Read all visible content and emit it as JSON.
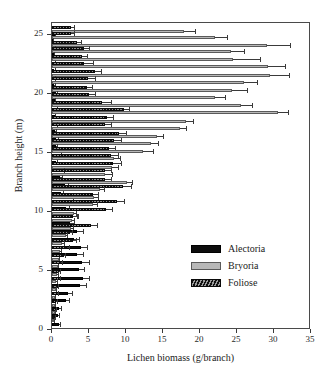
{
  "chart_data": {
    "type": "bar",
    "orientation": "horizontal",
    "title": "",
    "xlabel": "Lichen biomass (g/branch)",
    "ylabel": "Branch height (m)",
    "xlim": [
      0,
      35
    ],
    "ylim": [
      0,
      26
    ],
    "xticks": [
      0,
      5,
      10,
      15,
      20,
      25,
      30,
      35
    ],
    "yticks": [
      0,
      5,
      10,
      15,
      20,
      25
    ],
    "grid": false,
    "legend_position": "center-right",
    "legend": [
      "Alectoria",
      "Bryoria",
      "Foliose"
    ],
    "colors": {
      "Alectoria": "#0d0d0d",
      "Bryoria": "#b8b8b8",
      "Foliose": "#2b2b2b",
      "axis": "#3a3a3a",
      "error_bar": "#3a3a3a"
    },
    "categories": [
      25.4,
      24.9,
      24.2,
      23.7,
      23.0,
      22.4,
      21.7,
      21.1,
      20.4,
      19.8,
      19.1,
      18.5,
      17.8,
      17.2,
      16.5,
      15.9,
      15.2,
      14.6,
      13.9,
      13.3,
      12.6,
      12.0,
      11.3,
      10.7,
      10.0,
      9.4,
      8.7,
      8.1,
      7.4,
      6.8,
      6.1,
      5.5,
      4.8,
      4.2,
      3.5,
      2.9,
      2.2,
      1.6,
      0.9
    ],
    "series": [
      {
        "name": "Alectoria",
        "values": [
          0.35,
          0.2,
          0.3,
          0.25,
          0.4,
          0.3,
          0.35,
          0.3,
          0.5,
          0.35,
          0.55,
          0.4,
          0.5,
          0.45,
          0.6,
          0.5,
          1.0,
          0.55,
          1.3,
          1.1,
          1.7,
          1.2,
          2.3,
          1.9,
          2.8,
          2.4,
          3.4,
          3.0,
          3.9,
          3.4,
          4.1,
          3.6,
          4.2,
          3.8,
          2.2,
          1.9,
          1.0,
          0.8,
          0.9
        ],
        "errors": [
          0.2,
          0.1,
          0.2,
          0.15,
          0.2,
          0.2,
          0.2,
          0.2,
          0.25,
          0.2,
          0.3,
          0.2,
          0.25,
          0.25,
          0.3,
          0.25,
          0.4,
          0.3,
          0.5,
          0.4,
          0.6,
          0.45,
          0.7,
          0.6,
          0.8,
          0.7,
          0.9,
          0.8,
          1.0,
          0.9,
          1.0,
          0.9,
          1.0,
          0.9,
          0.7,
          0.6,
          0.4,
          0.3,
          0.35
        ]
      },
      {
        "name": "Bryoria",
        "values": [
          17.9,
          22.0,
          29.1,
          24.2,
          24.5,
          29.2,
          29.4,
          25.9,
          24.3,
          22.0,
          25.5,
          30.6,
          18.1,
          17.3,
          14.2,
          13.4,
          12.3,
          8.4,
          8.1,
          7.2,
          10.1,
          6.5,
          5.7,
          5.6,
          3.0,
          2.7,
          2.6,
          1.9,
          1.4,
          1.1,
          0.9,
          0.8,
          0.7,
          0.6,
          0.5,
          0.45,
          0.4,
          0.35,
          0.3
        ],
        "errors": [
          1.6,
          1.8,
          3.2,
          1.9,
          3.7,
          2.4,
          2.7,
          1.9,
          2.2,
          1.5,
          1.6,
          1.4,
          1.1,
          1.0,
          1.0,
          1.1,
          1.5,
          0.9,
          0.9,
          1.0,
          0.9,
          0.7,
          0.6,
          0.6,
          0.4,
          0.4,
          0.4,
          0.3,
          0.3,
          0.25,
          0.2,
          0.2,
          0.2,
          0.2,
          0.15,
          0.15,
          0.15,
          0.1,
          0.1
        ]
      },
      {
        "name": "Foliose",
        "values": [
          2.5,
          2.6,
          3.4,
          4.3,
          4.1,
          4.3,
          5.8,
          4.9,
          4.7,
          5.0,
          6.8,
          9.7,
          7.4,
          7.2,
          9.0,
          8.4,
          7.7,
          8.0,
          8.3,
          7.2,
          7.2,
          9.6,
          5.6,
          8.8,
          7.3,
          2.9,
          5.3,
          2.4,
          2.8,
          2.0,
          1.6,
          1.2,
          1.0,
          0.9,
          0.8,
          0.7,
          0.6,
          0.5,
          0.4
        ],
        "errors": [
          0.6,
          0.5,
          0.7,
          0.9,
          0.8,
          1.4,
          1.0,
          1.0,
          0.9,
          1.0,
          1.3,
          0.9,
          1.0,
          0.9,
          1.1,
          1.0,
          1.0,
          1.0,
          1.1,
          0.9,
          0.9,
          1.2,
          0.8,
          1.0,
          0.9,
          0.6,
          0.9,
          0.5,
          0.6,
          0.4,
          0.35,
          0.3,
          0.25,
          0.25,
          0.2,
          0.2,
          0.2,
          0.15,
          0.15
        ]
      }
    ]
  }
}
